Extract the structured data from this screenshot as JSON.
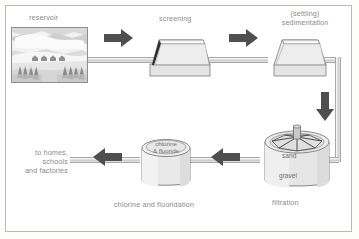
{
  "diagram": {
    "background_color": "#ffffff",
    "frame_color": "#b9b9b9",
    "label_color": "#8a8a8a",
    "arrow_color": "#4f4f4f",
    "pipe_color": "#c9c9c9"
  },
  "labels": {
    "reservoir": "reservoir",
    "screening": "screening",
    "sedimentation": "(settling)\nsedimentation",
    "filtration": "filtration",
    "chlorination": "chlorine and fluoridation",
    "output": "to homes, schools\nand factories"
  },
  "tank_labels": {
    "sand": "sand",
    "gravel": "gravel",
    "chlorine_fluoride": "chlorine\n& fluoride"
  },
  "arrows": [
    {
      "name": "arrow-reservoir-to-screening",
      "direction": "right"
    },
    {
      "name": "arrow-screening-to-sedimentation",
      "direction": "right"
    },
    {
      "name": "arrow-sedimentation-to-filtration",
      "direction": "down"
    },
    {
      "name": "arrow-filtration-to-chlorination",
      "direction": "left"
    },
    {
      "name": "arrow-chlorination-to-output",
      "direction": "left"
    }
  ],
  "stages": [
    {
      "name": "reservoir",
      "order": 1
    },
    {
      "name": "screening",
      "order": 2
    },
    {
      "name": "sedimentation",
      "order": 3
    },
    {
      "name": "filtration",
      "order": 4
    },
    {
      "name": "chlorination",
      "order": 5
    },
    {
      "name": "distribution",
      "order": 6
    }
  ]
}
